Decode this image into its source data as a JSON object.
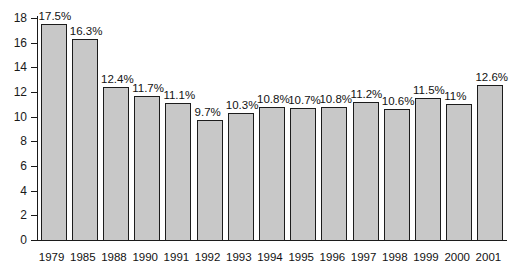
{
  "chart_data": {
    "type": "bar",
    "title": "",
    "subtitle": "",
    "xlabel": "",
    "ylabel": "",
    "categories": [
      "1979",
      "1985",
      "1988",
      "1990",
      "1991",
      "1992",
      "1993",
      "1994",
      "1995",
      "1996",
      "1997",
      "1998",
      "1999",
      "2000",
      "2001"
    ],
    "values": [
      17.5,
      16.3,
      12.4,
      11.7,
      11.1,
      9.7,
      10.3,
      10.8,
      10.7,
      10.8,
      11.2,
      10.6,
      11.5,
      11.0,
      12.6
    ],
    "data_labels": [
      "17.5%",
      "16.3%",
      "12.4%",
      "11.7%",
      "11.1%",
      "9.7%",
      "10.3%",
      "10.8%",
      "10.7%",
      "10.8%",
      "11.2%",
      "10.6%",
      "11.5%",
      "11%",
      "12.6%"
    ],
    "ylim": [
      0,
      18
    ],
    "ytick_values": [
      0,
      2,
      4,
      6,
      8,
      10,
      12,
      14,
      16,
      18
    ],
    "ytick_labels": [
      "0",
      "2",
      "4",
      "6",
      "8",
      "10",
      "12",
      "14",
      "16",
      "18"
    ],
    "grid": false,
    "legend": null,
    "legend_position": "none",
    "series": [
      {
        "name": "",
        "values": [
          17.5,
          16.3,
          12.4,
          11.7,
          11.1,
          9.7,
          10.3,
          10.8,
          10.7,
          10.8,
          11.2,
          10.6,
          11.5,
          11.0,
          12.6
        ],
        "bar_fill_color": "#c8c8c8",
        "bar_border_color": "#1c1c1c"
      }
    ],
    "axis_color": "#1a1a1a",
    "background_color": "#ffffff"
  }
}
